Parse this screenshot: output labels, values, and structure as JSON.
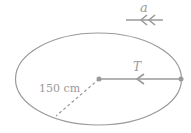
{
  "diagram": {
    "type": "physics-circular-motion",
    "labels": {
      "acceleration": "a",
      "tension": "T",
      "radius": "150 cm"
    },
    "colors": {
      "stroke": "#9a9a9a",
      "background": "#ffffff"
    }
  }
}
